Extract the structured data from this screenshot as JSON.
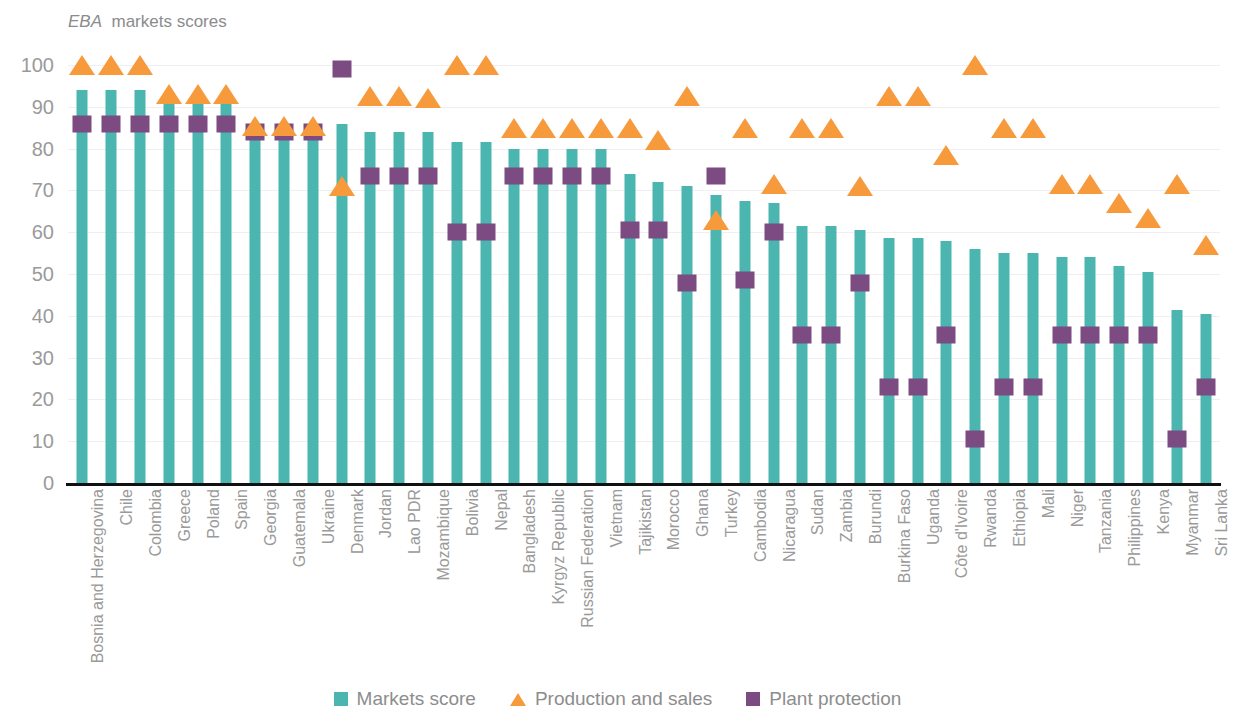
{
  "chart_data": {
    "type": "bar",
    "title_italic_word": "EBA",
    "xlabel": "",
    "ylabel": "",
    "ylim": [
      0,
      100
    ],
    "yticks": [
      0,
      10,
      20,
      30,
      40,
      50,
      60,
      70,
      80,
      90,
      100
    ],
    "grid": true,
    "legend_position": "bottom-center",
    "colors": {
      "markets_score": "#4BB5B0",
      "production_and_sales": "#F79A3C",
      "plant_protection": "#7B4B82",
      "axis": "#111111",
      "gridline": "#f0eef2",
      "text": "#9a9a9a"
    },
    "categories": [
      "Bosnia and Herzegovina",
      "Chile",
      "Colombia",
      "Greece",
      "Poland",
      "Spain",
      "Georgia",
      "Guatemala",
      "Ukraine",
      "Denmark",
      "Jordan",
      "Lao PDR",
      "Mozambique",
      "Bolivia",
      "Nepal",
      "Bangladesh",
      "Kyrgyz Republic",
      "Russian Federation",
      "Vietnam",
      "Tajikistan",
      "Morocco",
      "Ghana",
      "Turkey",
      "Cambodia",
      "Nicaragua",
      "Sudan",
      "Zambia",
      "Burundi",
      "Burkina Faso",
      "Uganda",
      "Côte d'Ivoire",
      "Rwanda",
      "Ethiopia",
      "Mali",
      "Niger",
      "Tanzania",
      "Philippines",
      "Kenya",
      "Myanmar",
      "Sri Lanka"
    ],
    "series": [
      {
        "name": "Markets score",
        "marker": "bar",
        "values": [
          94,
          94,
          94,
          91,
          91,
          91,
          84,
          84,
          84,
          86,
          84,
          84,
          84,
          81.5,
          81.5,
          80,
          80,
          80,
          80,
          74,
          72,
          71,
          69,
          67.5,
          67,
          61.5,
          61.5,
          60.5,
          58.5,
          58.5,
          58,
          56,
          55,
          55,
          54,
          54,
          52,
          50.5,
          41.5,
          40.5
        ]
      },
      {
        "name": "Production and sales",
        "marker": "triangle",
        "values": [
          100,
          100,
          100,
          93,
          93,
          93,
          85.5,
          85.5,
          85.5,
          71,
          92.5,
          92.5,
          92,
          100,
          100,
          85,
          85,
          85,
          85,
          85,
          82,
          92.5,
          63,
          85,
          71.5,
          85,
          85,
          71,
          92.5,
          92.5,
          78.5,
          100,
          85,
          85,
          71.5,
          71.5,
          67,
          63.5,
          71.5,
          57
        ]
      },
      {
        "name": "Plant protection",
        "marker": "square",
        "values": [
          88,
          88,
          88,
          88,
          88,
          88,
          86,
          86,
          86,
          101,
          75.5,
          75.5,
          75.5,
          62,
          62,
          75.5,
          75.5,
          75.5,
          75.5,
          62.5,
          62.5,
          50,
          75.5,
          50.5,
          62,
          37.5,
          37.5,
          50,
          25,
          25,
          37.5,
          12.5,
          25,
          25,
          37.5,
          37.5,
          37.5,
          37.5,
          12.5,
          25
        ]
      }
    ]
  },
  "legend": {
    "items": [
      {
        "label": "Markets score",
        "marker": "square",
        "color": "#4BB5B0"
      },
      {
        "label": "Production and sales",
        "marker": "triangle",
        "color": "#F79A3C"
      },
      {
        "label": "Plant protection",
        "marker": "square",
        "color": "#7B4B82"
      }
    ]
  }
}
